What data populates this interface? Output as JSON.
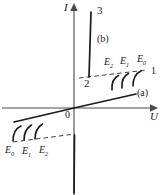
{
  "figure": {
    "type": "iv-characteristic-diagram",
    "axes": {
      "y_label": "I",
      "x_label": "U",
      "origin_label": "0"
    },
    "branch_numbers": {
      "n1": "1",
      "n2": "2",
      "n3": "3"
    },
    "annotations": {
      "region_a": "(a)",
      "region_b": "(b)"
    },
    "upper_field_labels": [
      {
        "base": "E",
        "sub": "2"
      },
      {
        "base": "E",
        "sub": "1"
      },
      {
        "base": "E",
        "sub": "0"
      }
    ],
    "lower_field_labels": [
      {
        "base": "E",
        "sub": "0"
      },
      {
        "base": "E",
        "sub": "1"
      },
      {
        "base": "E",
        "sub": "2"
      }
    ],
    "colors": {
      "stroke": "#1a1a1a",
      "axis": "#3a3a3a",
      "background": "#ffffff"
    }
  }
}
